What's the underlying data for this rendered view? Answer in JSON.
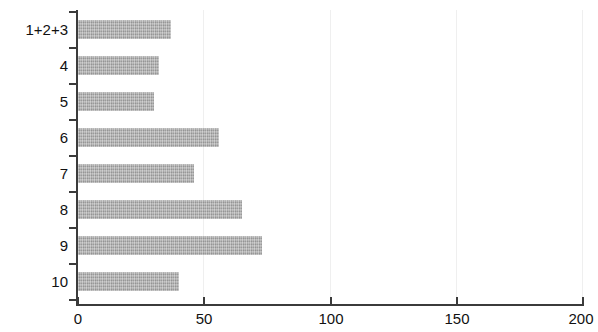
{
  "chart_data": {
    "type": "bar",
    "orientation": "horizontal",
    "title": "",
    "subtitle": "",
    "xlabel": "",
    "ylabel": "",
    "categories": [
      "1+2+3",
      "4",
      "5",
      "6",
      "7",
      "8",
      "9",
      "10"
    ],
    "values": [
      37,
      32,
      30,
      56,
      46,
      65,
      73,
      40
    ],
    "series": [
      {
        "name": "",
        "values": [
          37,
          32,
          30,
          56,
          46,
          65,
          73,
          40
        ]
      }
    ],
    "xlim": [
      0,
      200
    ],
    "xticks": [
      0,
      50,
      100,
      150,
      200
    ],
    "xtick_labels": [
      "0",
      "50",
      "100",
      "150",
      "200"
    ],
    "grid": true,
    "grid_axis": "x",
    "legend": false,
    "legend_position": "none",
    "bar_color": "#a9a9a9",
    "axis_color": "#3b3b3b",
    "grid_color": "#efefef",
    "text_color": "#111111",
    "annotations": []
  }
}
